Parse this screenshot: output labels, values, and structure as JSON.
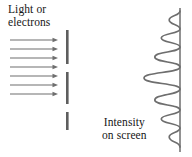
{
  "figure": {
    "background_color": "#ffffff",
    "stroke_color": "#6e6e6e",
    "text_color": "#161616"
  },
  "labels": {
    "source": {
      "line1": "Light or",
      "line2": "electrons"
    },
    "intensity": {
      "line1": "Intensity",
      "line2": "on screen"
    }
  },
  "beam": {
    "name": "incident-beam-arrows",
    "count": 7,
    "x_start": 10,
    "x_end": 58,
    "y_positions": [
      40,
      49,
      58,
      67,
      76,
      85,
      94
    ],
    "color": "#6e6e6e"
  },
  "barrier": {
    "name": "double-slit-barrier",
    "x": 66,
    "width": 2.6,
    "color": "#5e5e5e",
    "bars": [
      {
        "y_top": 30,
        "y_bottom": 64
      },
      {
        "y_top": 72,
        "y_bottom": 104
      },
      {
        "y_top": 112,
        "y_bottom": 130
      }
    ],
    "slits": [
      {
        "y_top": 64,
        "y_bottom": 72
      },
      {
        "y_top": 104,
        "y_bottom": 112
      }
    ]
  },
  "screen": {
    "name": "detection-screen",
    "x": 180,
    "y_top": 8,
    "y_bottom": 152,
    "color": "#6e6e6e"
  },
  "chart_data": {
    "type": "line",
    "title": "Intensity on screen",
    "xlabel": "Intensity",
    "ylabel": "Position on screen",
    "orientation": "vertical-screen",
    "baseline_x": 180,
    "note": "Interference fringe pattern: intensity plotted horizontally leftward from the screen line; position runs vertically.",
    "peaks": [
      {
        "y": 20,
        "intensity": 0.3
      },
      {
        "y": 38,
        "intensity": 0.52
      },
      {
        "y": 57,
        "intensity": 0.7
      },
      {
        "y": 78,
        "intensity": 1.0
      },
      {
        "y": 100,
        "intensity": 0.7
      },
      {
        "y": 119,
        "intensity": 0.52
      },
      {
        "y": 137,
        "intensity": 0.3
      }
    ],
    "minima_y": [
      11,
      29,
      47,
      67,
      89,
      110,
      128,
      147
    ],
    "max_excursion_px": 36
  }
}
